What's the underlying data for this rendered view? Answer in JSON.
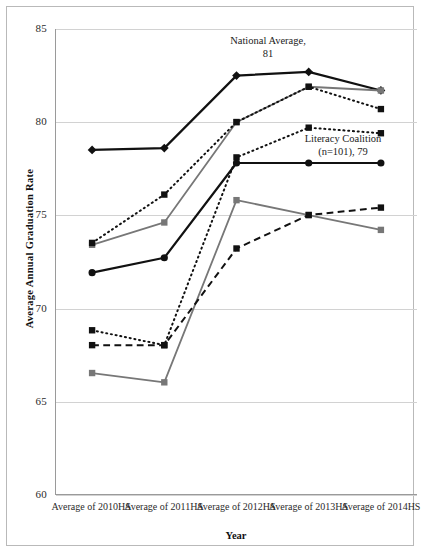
{
  "chart_data": {
    "type": "line",
    "title": "",
    "xlabel": "Year",
    "ylabel": "Average Annual Graduation Rate",
    "categories": [
      "Average of\n2010HS",
      "Average of\n2011HS",
      "Average of\n2012HS",
      "Average of\n2013HS",
      "Average of\n2014HS"
    ],
    "ylim": [
      60,
      85
    ],
    "yticks": [
      60,
      65,
      70,
      75,
      80,
      85
    ],
    "grid": true,
    "legend": "none",
    "series": [
      {
        "name": "National Average",
        "marker": "diamond",
        "line_style": "solid",
        "color": "#111111",
        "width": 2.2,
        "values": [
          78.5,
          78.6,
          82.5,
          82.7,
          81.7
        ]
      },
      {
        "name": "Series grey upper",
        "marker": "square",
        "line_style": "solid",
        "color": "#777777",
        "width": 1.8,
        "values": [
          73.4,
          74.6,
          80.0,
          81.9,
          81.7
        ]
      },
      {
        "name": "Series dotted upper",
        "marker": "square",
        "line_style": "dotted",
        "color": "#111111",
        "width": 2.0,
        "values": [
          73.5,
          76.1,
          80.0,
          81.9,
          80.7
        ]
      },
      {
        "name": "Series dotted middle",
        "marker": "square",
        "line_style": "dotted",
        "color": "#111111",
        "width": 2.0,
        "values": [
          68.8,
          68.0,
          78.1,
          79.7,
          79.4
        ]
      },
      {
        "name": "Literacy Coalition",
        "marker": "circle",
        "line_style": "solid",
        "color": "#111111",
        "width": 2.2,
        "values": [
          71.9,
          72.7,
          77.8,
          77.8,
          77.8
        ]
      },
      {
        "name": "Series grey lower",
        "marker": "square",
        "line_style": "solid",
        "color": "#777777",
        "width": 1.8,
        "values": [
          66.5,
          66.0,
          75.8,
          75.0,
          74.2
        ]
      },
      {
        "name": "Series dashed lower",
        "marker": "square",
        "line_style": "dashed",
        "color": "#111111",
        "width": 2.0,
        "values": [
          68.0,
          68.0,
          73.2,
          75.0,
          75.4
        ]
      }
    ],
    "annotations": [
      {
        "id": "national",
        "text": "National Average,\n81"
      },
      {
        "id": "coalition",
        "text": "Literacy Coalition\n(n=101), 79"
      }
    ]
  }
}
